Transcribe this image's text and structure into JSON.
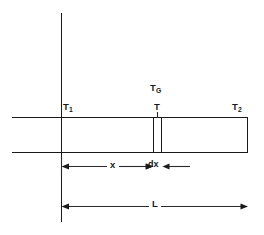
{
  "figure": {
    "kind": "heat-conduction-bar-schematic",
    "width": 264,
    "height": 235,
    "background_color": "#ffffff",
    "line_color": "#1a1a1a"
  },
  "labels": {
    "t1": {
      "base": "T",
      "sub": "1"
    },
    "tg": {
      "base": "T",
      "sub": "G"
    },
    "t": {
      "base": "T",
      "sub": ""
    },
    "t2": {
      "base": "T",
      "sub": "2"
    },
    "x": "x",
    "dx": "dx",
    "l": "L"
  },
  "geometry": {
    "wall_line": {
      "x": 61,
      "y_top": 13,
      "y_bottom": 222
    },
    "bar": {
      "x_left": 12,
      "x_right": 248,
      "y_top": 117,
      "y_bottom": 152
    },
    "slab": {
      "x_left": 153,
      "x_right": 161
    },
    "dimension_x": {
      "y": 166,
      "x_start": 61,
      "x_end": 153
    },
    "dimension_dx": {
      "y": 166,
      "x_start": 153,
      "x_end": 190
    },
    "dimension_l": {
      "y": 206,
      "x_start": 61,
      "x_end": 248
    }
  }
}
